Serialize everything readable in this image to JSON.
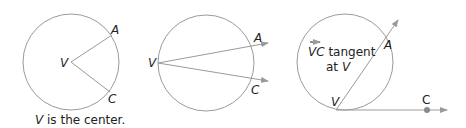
{
  "colors": {
    "stroke": "#9a9a9a",
    "text": "#222222",
    "point": "#8a8a8a"
  },
  "figures": [
    {
      "id": "center",
      "labels": {
        "vertex": "V",
        "a": "A",
        "c": "C"
      },
      "caption_var": "V",
      "caption_rest": " is the center."
    },
    {
      "id": "on-circle",
      "labels": {
        "vertex": "V",
        "a": "A",
        "c": "C"
      }
    },
    {
      "id": "tangent",
      "labels": {
        "vertex": "V",
        "a": "A",
        "c": "C"
      },
      "note_ray": "VC",
      "note_line1_rest": " tangent",
      "note_line2_pre": "at ",
      "note_line2_var": "V"
    }
  ]
}
